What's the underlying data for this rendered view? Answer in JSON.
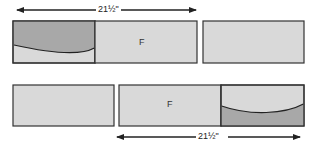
{
  "diagram": {
    "top_row": {
      "dimension_label": "21½\"",
      "panels": [
        {
          "id": "A",
          "label": "",
          "style": "curved-dark-top"
        },
        {
          "id": "B",
          "label": "F",
          "style": "plain"
        },
        {
          "id": "C",
          "label": "",
          "style": "plain"
        }
      ]
    },
    "bottom_row": {
      "dimension_label": "21½\"",
      "panels": [
        {
          "id": "D",
          "label": "",
          "style": "plain"
        },
        {
          "id": "E",
          "label": "F",
          "style": "plain"
        },
        {
          "id": "F",
          "label": "",
          "style": "curved-dark-bottom"
        }
      ]
    },
    "colors": {
      "light_fill": "#d9d9d9",
      "dark_fill": "#a8a8a8",
      "stroke": "#333333"
    }
  }
}
